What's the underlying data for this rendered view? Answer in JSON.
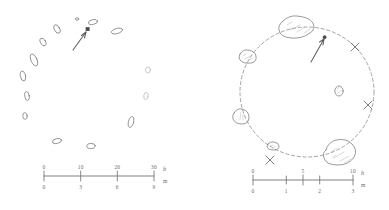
{
  "figure": {
    "type": "hand-drawn-site-plan",
    "background_color": "#ffffff",
    "ink_color": "#7a7a78",
    "panels": [
      {
        "id": "left-plan",
        "name": "stone-ring-plan-outlying",
        "stone_count": 14,
        "ring_style": "implied-open-ring",
        "has_north-arrow": true,
        "stones": [
          {
            "cx": 57,
            "cy": 29,
            "rx": 2.6,
            "ry": 4.6,
            "rot": -28
          },
          {
            "cx": 43,
            "cy": 42,
            "rx": 2.5,
            "ry": 4.2,
            "rot": -30
          },
          {
            "cx": 34,
            "cy": 60,
            "rx": 3.0,
            "ry": 6.4,
            "rot": -24
          },
          {
            "cx": 23,
            "cy": 76,
            "rx": 2.6,
            "ry": 5.0,
            "rot": -12
          },
          {
            "cx": 27,
            "cy": 96,
            "rx": 2.3,
            "ry": 4.4,
            "rot": -8
          },
          {
            "cx": 25,
            "cy": 116,
            "rx": 2.2,
            "ry": 3.4,
            "rot": -6
          },
          {
            "cx": 57,
            "cy": 141,
            "rx": 4.6,
            "ry": 2.4,
            "rot": -12
          },
          {
            "cx": 91,
            "cy": 146,
            "rx": 4.2,
            "ry": 2.6,
            "rot": -4
          },
          {
            "cx": 131,
            "cy": 122,
            "rx": 2.6,
            "ry": 5.6,
            "rot": 14
          },
          {
            "cx": 146,
            "cy": 96,
            "rx": 2.2,
            "ry": 3.6,
            "rot": 8
          },
          {
            "cx": 148,
            "cy": 70,
            "rx": 2.4,
            "ry": 3.0,
            "rot": 0
          },
          {
            "cx": 117,
            "cy": 31,
            "rx": 5.8,
            "ry": 2.6,
            "rot": -16
          },
          {
            "cx": 93,
            "cy": 22,
            "rx": 4.6,
            "ry": 2.4,
            "rot": -12
          },
          {
            "cx": 77,
            "cy": 19,
            "rx": 1.6,
            "ry": 1.3,
            "rot": 0
          }
        ],
        "arrow": {
          "from": [
            73,
            50
          ],
          "to": [
            87,
            31
          ],
          "marker": [
            88,
            30
          ]
        },
        "scale_bar": {
          "x0": 44,
          "x1": 154,
          "y": 176,
          "top_unit": "ft",
          "bottom_unit": "m",
          "top_labels": [
            "0",
            "10",
            "20",
            "30"
          ],
          "top_positions": [
            0,
            0.333,
            0.667,
            1.0
          ],
          "bottom_labels": [
            "0",
            "3",
            "6",
            "9"
          ],
          "bottom_positions": [
            0,
            0.333,
            0.667,
            1.0
          ]
        }
      },
      {
        "id": "right-plan",
        "name": "stone-ring-plan-detail",
        "ring_style": "dashed-circle",
        "has_north-arrow": true,
        "circle": {
          "cx": 307,
          "cy": 92,
          "rx": 67,
          "ry": 65
        },
        "stones": [
          {
            "cx": 295,
            "cy": 28,
            "w": 26,
            "h": 15,
            "rot": -8,
            "hatched": true
          },
          {
            "cx": 246,
            "cy": 57,
            "w": 14,
            "h": 11,
            "rot": 0,
            "hatched": true
          },
          {
            "cx": 239,
            "cy": 117,
            "w": 11,
            "h": 13,
            "rot": 0,
            "hatched": true
          },
          {
            "cx": 272,
            "cy": 147,
            "w": 9,
            "h": 7,
            "rot": 0,
            "hatched": true
          },
          {
            "cx": 337,
            "cy": 155,
            "w": 25,
            "h": 19,
            "rot": 6,
            "hatched": true
          },
          {
            "cx": 339,
            "cy": 91,
            "w": 8,
            "h": 9,
            "rot": 0,
            "hatched": false
          }
        ],
        "x_marks": [
          [
            355,
            47
          ],
          [
            368,
            105
          ],
          [
            270,
            160
          ]
        ],
        "arrow": {
          "from": [
            311,
            62
          ],
          "to": [
            325,
            38
          ],
          "marker": [
            326,
            37
          ]
        },
        "scale_bar": {
          "x0": 253,
          "x1": 353,
          "y": 180,
          "top_unit": "ft",
          "bottom_unit": "m",
          "top_labels": [
            "0",
            "5",
            "10"
          ],
          "top_positions": [
            0,
            0.5,
            1.0
          ],
          "bottom_labels": [
            "0",
            "1",
            "2",
            "3"
          ],
          "bottom_positions": [
            0,
            0.333,
            0.667,
            1.0
          ]
        }
      }
    ]
  }
}
